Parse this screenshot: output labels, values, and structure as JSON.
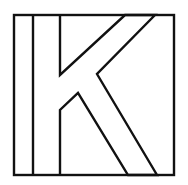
{
  "figure": {
    "letter": "K",
    "stroke_color": "#111111",
    "background_color": "#ffffff"
  }
}
